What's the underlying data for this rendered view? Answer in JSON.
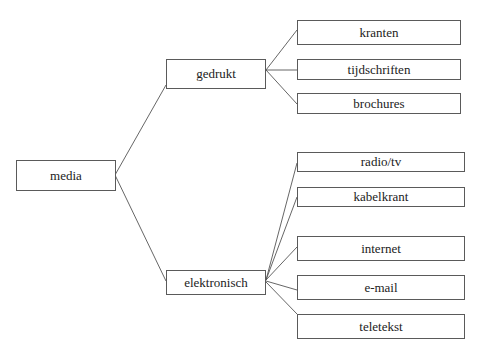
{
  "diagram": {
    "type": "tree",
    "root": {
      "label": "media",
      "children": [
        {
          "label": "gedrukt",
          "children": [
            {
              "label": "kranten"
            },
            {
              "label": "tijdschriften"
            },
            {
              "label": "brochures"
            }
          ]
        },
        {
          "label": "elektronisch",
          "children": [
            {
              "label": "radio/tv"
            },
            {
              "label": "kabelkrant"
            },
            {
              "label": "internet"
            },
            {
              "label": "e-mail"
            },
            {
              "label": "teletekst"
            }
          ]
        }
      ]
    }
  },
  "colors": {
    "line": "#555555",
    "border": "#5a5a5a",
    "text": "#222222",
    "background": "#ffffff"
  }
}
